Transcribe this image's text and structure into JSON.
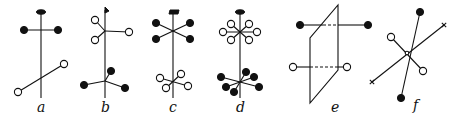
{
  "figure": {
    "colors": {
      "ink": "#111111",
      "background": "#ffffff"
    },
    "panels": [
      {
        "id": "a",
        "label": "a",
        "label_pos": [
          41,
          112
        ],
        "lines": [
          [
            41,
            12,
            41,
            98
          ],
          [
            24,
            30,
            58,
            30
          ],
          [
            18,
            92,
            64,
            64
          ]
        ],
        "dashed": [],
        "caps": [
          {
            "type": "ellipse",
            "x": 41,
            "y": 12
          }
        ],
        "filled": [
          [
            24,
            30
          ],
          [
            58,
            30
          ]
        ],
        "open": [
          [
            18,
            92
          ],
          [
            64,
            64
          ]
        ],
        "crosses": []
      },
      {
        "id": "b",
        "label": "b",
        "label_pos": [
          105,
          112
        ],
        "lines": [
          [
            105,
            10,
            105,
            98
          ],
          [
            105,
            31,
            95,
            20
          ],
          [
            105,
            31,
            95,
            40
          ],
          [
            105,
            31,
            129,
            32
          ],
          [
            105,
            81,
            111,
            71
          ],
          [
            105,
            81,
            84,
            85
          ],
          [
            105,
            81,
            125,
            88
          ]
        ],
        "dashed": [],
        "caps": [
          {
            "type": "flag",
            "x": 105,
            "y": 10
          }
        ],
        "filled": [
          [
            111,
            71
          ],
          [
            84,
            85
          ],
          [
            125,
            88
          ]
        ],
        "open": [
          [
            95,
            20
          ],
          [
            95,
            40
          ],
          [
            129,
            32
          ]
        ],
        "crosses": []
      },
      {
        "id": "c",
        "label": "c",
        "label_pos": [
          173,
          112
        ],
        "lines": [
          [
            173,
            12,
            173,
            98
          ],
          [
            156,
            23,
            190,
            39
          ],
          [
            156,
            39,
            190,
            23
          ],
          [
            160,
            78,
            188,
            86
          ],
          [
            166,
            88,
            181,
            74
          ]
        ],
        "dashed": [],
        "caps": [
          {
            "type": "bar",
            "x": 173,
            "y": 12
          }
        ],
        "filled": [
          [
            156,
            23
          ],
          [
            156,
            39
          ],
          [
            190,
            23
          ],
          [
            190,
            39
          ]
        ],
        "open": [
          [
            160,
            78
          ],
          [
            181,
            74
          ],
          [
            166,
            88
          ],
          [
            188,
            86
          ]
        ],
        "crosses": []
      },
      {
        "id": "d",
        "label": "d",
        "label_pos": [
          240,
          112
        ],
        "lines": [
          [
            240,
            12,
            240,
            98
          ],
          [
            223,
            32,
            257,
            32
          ],
          [
            231,
            24,
            249,
            40
          ],
          [
            249,
            24,
            231,
            40
          ],
          [
            221,
            77,
            259,
            87
          ],
          [
            226,
            87,
            254,
            77
          ],
          [
            234,
            92,
            246,
            72
          ]
        ],
        "dashed": [],
        "caps": [
          {
            "type": "ellipse",
            "x": 240,
            "y": 12
          }
        ],
        "filled": [
          [
            221,
            77
          ],
          [
            259,
            87
          ],
          [
            226,
            87
          ],
          [
            254,
            77
          ],
          [
            234,
            92
          ],
          [
            246,
            72
          ]
        ],
        "open": [
          [
            223,
            32
          ],
          [
            257,
            32
          ],
          [
            231,
            24
          ],
          [
            249,
            40
          ],
          [
            249,
            24
          ],
          [
            231,
            40
          ]
        ],
        "crosses": []
      },
      {
        "id": "e",
        "label": "e",
        "label_pos": [
          335,
          112
        ],
        "polygon": [
          [
            338,
            5
          ],
          [
            338,
            70
          ],
          [
            310,
            103
          ],
          [
            310,
            38
          ]
        ],
        "lines": [
          [
            300,
            25,
            323,
            25
          ],
          [
            338,
            25,
            368,
            25
          ],
          [
            293,
            67,
            310,
            67
          ],
          [
            338,
            67,
            347,
            67
          ]
        ],
        "dashed": [
          [
            323,
            25,
            338,
            25
          ],
          [
            310,
            67,
            338,
            67
          ]
        ],
        "caps": [],
        "filled": [
          [
            300,
            25
          ],
          [
            368,
            25
          ]
        ],
        "open": [
          [
            293,
            67
          ],
          [
            347,
            67
          ]
        ],
        "crosses": []
      },
      {
        "id": "f",
        "label": "f",
        "label_pos": [
          416,
          110
        ],
        "lines": [
          [
            420,
            12,
            401,
            98
          ],
          [
            444,
            25,
            372,
            82
          ],
          [
            391,
            37,
            423,
            71
          ]
        ],
        "dashed": [],
        "caps": [],
        "filled": [
          [
            420,
            12
          ],
          [
            401,
            98
          ]
        ],
        "open": [
          [
            391,
            37
          ],
          [
            423,
            71
          ],
          [
            407,
            53
          ]
        ],
        "crosses": [
          [
            444,
            25
          ],
          [
            372,
            82
          ]
        ]
      }
    ]
  }
}
